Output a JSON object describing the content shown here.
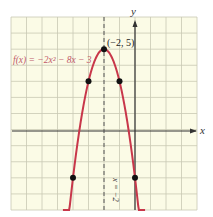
{
  "chart_data": {
    "type": "line",
    "title": "",
    "function_label": "f(x) = -2x² - 8x - 3",
    "xlabel": "x",
    "ylabel": "y",
    "xlim": [
      -8,
      4
    ],
    "ylim": [
      -5,
      7
    ],
    "grid": true,
    "series": [
      {
        "name": "f(x) = -2x² - 8x - 3",
        "color": "#c8374a",
        "x": [
          -4.6,
          -4,
          -3,
          -2,
          -1,
          0,
          0.6
        ],
        "y": [
          -8.52,
          -3,
          3,
          5,
          3,
          -3,
          -8.52
        ]
      }
    ],
    "points": [
      {
        "x": -2,
        "y": 5,
        "label": "(-2, 5)"
      },
      {
        "x": -3,
        "y": 3
      },
      {
        "x": -1,
        "y": 3
      },
      {
        "x": -4,
        "y": -3
      },
      {
        "x": 0,
        "y": -3
      }
    ],
    "annotations": [
      {
        "type": "axis_of_symmetry",
        "x": -2,
        "label": "x = -2",
        "style": "dashed"
      }
    ]
  },
  "labels": {
    "function": "f(x) = −2x² − 8x − 3",
    "vertex": "(−2, 5)",
    "x_axis": "x",
    "y_axis": "y",
    "symmetry": "x = −2"
  },
  "colors": {
    "curve": "#c8374a",
    "grid_bg": "#fbfbe6",
    "grid_line": "#c9c9b4",
    "axis": "#333333",
    "function_label": "#c05a6a"
  }
}
